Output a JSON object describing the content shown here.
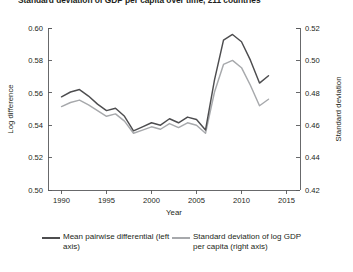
{
  "figure": {
    "title": "Standard deviation of GDP per capita over time, 211 countries",
    "background_color": "#ffffff"
  },
  "axes": {
    "x": {
      "label": "Year",
      "ticks": [
        "1990",
        "1995",
        "2000",
        "2005",
        "2010",
        "2015"
      ],
      "min": 1988.5,
      "max": 2016.5
    },
    "y_left": {
      "label": "Log difference",
      "ticks": [
        "0.50",
        "0.52",
        "0.54",
        "0.56",
        "0.58",
        "0.60"
      ],
      "min": 0.5,
      "max": 0.6
    },
    "y_right": {
      "label": "Standard deviation",
      "ticks": [
        "0.42",
        "0.44",
        "0.46",
        "0.48",
        "0.50",
        "0.52"
      ],
      "min": 0.42,
      "max": 0.52
    }
  },
  "legend": {
    "entries": [
      {
        "label": "Mean pairwise differential (left axis)",
        "color": "#4d4d4f",
        "swatch": "dark"
      },
      {
        "label": "Standard deviation of log GDP per capita (right axis)",
        "color": "#a7a9ac",
        "swatch": "light"
      }
    ]
  },
  "chart_data": {
    "type": "line",
    "title": "Standard deviation of GDP per capita over time, 211 countries",
    "xlabel": "Year",
    "ylabel": "Log difference",
    "ylabel_right": "Standard deviation",
    "xlim": [
      1988.5,
      2016.5
    ],
    "ylim": [
      0.5,
      0.6
    ],
    "ylim_right": [
      0.42,
      0.52
    ],
    "grid": false,
    "legend_position": "below",
    "x": [
      1990,
      1991,
      1992,
      1993,
      1994,
      1995,
      1996,
      1997,
      1998,
      1999,
      2000,
      2001,
      2002,
      2003,
      2004,
      2005,
      2006,
      2007,
      2008,
      2009,
      2010,
      2011,
      2012,
      2013
    ],
    "series": [
      {
        "name": "Mean pairwise differential (left axis)",
        "axis": "left",
        "color": "#4d4d4f",
        "values": [
          0.5575,
          0.5605,
          0.562,
          0.558,
          0.553,
          0.549,
          0.5505,
          0.5455,
          0.5365,
          0.539,
          0.5415,
          0.54,
          0.544,
          0.5415,
          0.545,
          0.5435,
          0.537,
          0.568,
          0.5925,
          0.596,
          0.5915,
          0.58,
          0.566,
          0.5705
        ]
      },
      {
        "name": "Standard deviation of log GDP per capita (right axis)",
        "axis": "right",
        "color": "#a7a9ac",
        "values": [
          0.4715,
          0.474,
          0.4755,
          0.4725,
          0.469,
          0.4655,
          0.467,
          0.4625,
          0.455,
          0.457,
          0.459,
          0.4575,
          0.461,
          0.4585,
          0.4615,
          0.46,
          0.455,
          0.4805,
          0.4975,
          0.5,
          0.4955,
          0.4845,
          0.472,
          0.476
        ]
      }
    ]
  }
}
